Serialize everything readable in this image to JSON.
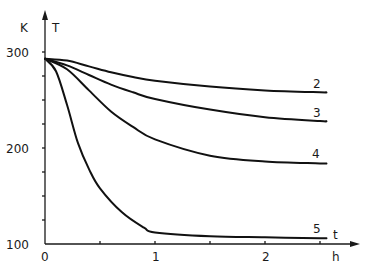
{
  "chart_data": {
    "type": "line",
    "title": "",
    "xlabel": "t",
    "xunit": "h",
    "ylabel": "T",
    "yunit": "K",
    "xlim": [
      0,
      2.6
    ],
    "ylim": [
      100,
      320
    ],
    "xticks": [
      0,
      0.5,
      1,
      1.5,
      2,
      2.5
    ],
    "xtick_labels": [
      "0",
      "1",
      "2"
    ],
    "yticks": [
      100,
      125,
      150,
      175,
      200,
      225,
      250,
      275,
      300
    ],
    "ytick_labels": [
      "100",
      "200",
      "300"
    ],
    "grid": false,
    "legend": "inline curve labels at right end",
    "series": [
      {
        "name": "2",
        "x": [
          0,
          0.2,
          0.4,
          0.6,
          0.8,
          1.0,
          1.5,
          2.0,
          2.5
        ],
        "values": [
          293,
          291,
          285,
          279,
          274,
          270,
          264,
          260,
          258
        ]
      },
      {
        "name": "3",
        "x": [
          0,
          0.2,
          0.4,
          0.6,
          0.8,
          1.0,
          1.5,
          2.0,
          2.5
        ],
        "values": [
          293,
          286,
          276,
          266,
          258,
          251,
          240,
          232,
          228
        ]
      },
      {
        "name": "4",
        "x": [
          0,
          0.2,
          0.4,
          0.6,
          0.8,
          1.0,
          1.5,
          2.0,
          2.5
        ],
        "values": [
          293,
          282,
          260,
          238,
          222,
          209,
          192,
          186,
          184
        ]
      },
      {
        "name": "5",
        "x": [
          0,
          0.1,
          0.2,
          0.3,
          0.4,
          0.5,
          0.7,
          0.9,
          1.0,
          1.5,
          2.0,
          2.5
        ],
        "values": [
          293,
          280,
          245,
          205,
          178,
          158,
          133,
          117,
          112,
          108,
          107,
          106
        ]
      }
    ]
  },
  "labels": {
    "y_unit": "K",
    "y_symbol": "T",
    "x_symbol": "t",
    "x_unit": "h",
    "y300": "300",
    "y200": "200",
    "y100": "100",
    "x0": "0",
    "x1": "1",
    "x2": "2",
    "c2": "2",
    "c3": "3",
    "c4": "4",
    "c5": "5"
  }
}
